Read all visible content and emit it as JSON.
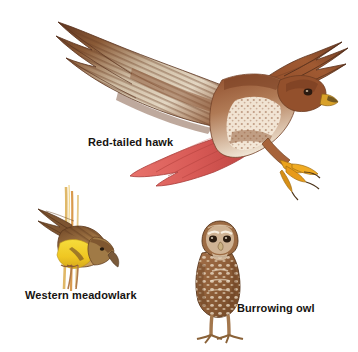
{
  "plate": {
    "kind": "natural-history-illustration-plate",
    "background_color": "#ffffff",
    "width": 358,
    "height": 352,
    "label_text_color": "#161310"
  },
  "figures": [
    {
      "id": "red-tailed-hawk",
      "label": "Red-tailed hawk",
      "pose": "in flight, wings spread, talons extended",
      "colors": {
        "body": "#9a4a2a",
        "wing_dark": "#6b3a22",
        "wing_pale": "#e8dccb",
        "breast": "#f2e7d8",
        "tail": "#e0645f",
        "tail_shade": "#c24a49",
        "talon": "#e8a317",
        "beak": "#d9a22a",
        "eye": "#2b1a10"
      }
    },
    {
      "id": "western-meadowlark",
      "label": "Western meadowlark",
      "pose": "clinging to upright grass stems, head angled down",
      "colors": {
        "breast": "#f2d22a",
        "back": "#8d6235",
        "wing_dark": "#6a4526",
        "stem": "#d9a05a",
        "stem_alt": "#e8c27a",
        "beak": "#7a5a3a",
        "eye": "#241a10"
      }
    },
    {
      "id": "burrowing-owl",
      "label": "Burrowing owl",
      "pose": "standing upright on long legs",
      "colors": {
        "body": "#9c6b43",
        "body_dark": "#6f4524",
        "spots": "#f3e6d2",
        "face": "#d8c0a2",
        "legs": "#a3774d",
        "eye": "#2a1c10",
        "brow": "#f5ecdd"
      }
    }
  ]
}
